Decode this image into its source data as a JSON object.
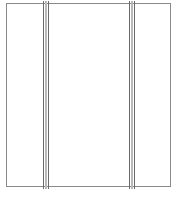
{
  "diagram": {
    "type": "panel-with-two-vertical-dividers",
    "frame": {
      "x": 6,
      "y": 3,
      "width": 165,
      "height": 184,
      "stroke": "#8a8a8a"
    },
    "dividers": [
      {
        "id": "left",
        "x": 43,
        "line_color": "#6a6a6a",
        "fill_color": "#b9b9b9"
      },
      {
        "id": "right",
        "x": 129,
        "line_color": "#6a6a6a",
        "fill_color": "#b9b9b9"
      }
    ],
    "sections": [
      "left",
      "center",
      "right"
    ]
  }
}
